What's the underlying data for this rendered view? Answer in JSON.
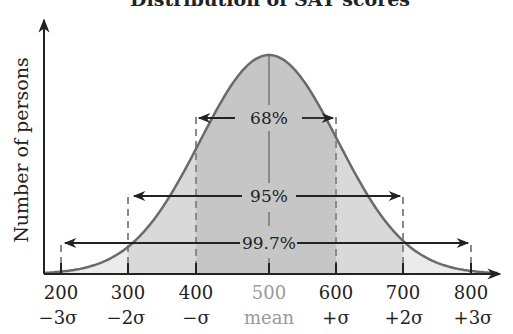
{
  "chart_data": {
    "type": "area",
    "title": "Distribution of SAT scores",
    "xlabel": "",
    "ylabel": "Number of persons",
    "distribution": "normal",
    "mean": 500,
    "std_dev": 100,
    "x_ticks": [
      {
        "value": "200",
        "sigma": "−3σ"
      },
      {
        "value": "300",
        "sigma": "−2σ"
      },
      {
        "value": "400",
        "sigma": "−σ"
      },
      {
        "value": "500",
        "sigma": "mean"
      },
      {
        "value": "600",
        "sigma": "+σ"
      },
      {
        "value": "700",
        "sigma": "+2σ"
      },
      {
        "value": "800",
        "sigma": "+3σ"
      }
    ],
    "annotations": [
      {
        "label": "68%",
        "from": 400,
        "to": 600
      },
      {
        "label": "95%",
        "from": 300,
        "to": 700
      },
      {
        "label": "99.7%",
        "from": 200,
        "to": 800
      }
    ],
    "grid": false,
    "legend": null,
    "colors": {
      "curve": "#6a6a6a",
      "band_1sigma": "#c6c6c6",
      "band_2sigma": "#d9d9d9",
      "band_3sigma": "#ebebeb",
      "dashed": "#8a8a8a",
      "axis": "#222222"
    }
  }
}
